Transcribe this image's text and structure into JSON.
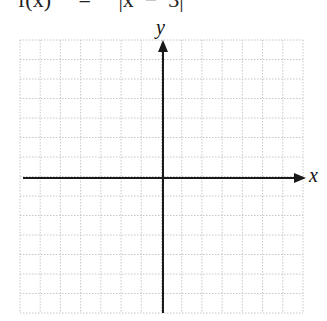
{
  "header": {
    "formula_fragment": "f(x)     =     |x  −  3|"
  },
  "graph": {
    "x_axis_label": "x",
    "y_axis_label": "y",
    "grid": {
      "columns": 14,
      "rows": 14,
      "left": 20,
      "top": 40,
      "right": 303,
      "bottom": 313,
      "line_color": "#c8c8c8",
      "style": "dotted"
    },
    "origin": {
      "x": 163,
      "y": 178
    },
    "axis_color": "#1a1a1a"
  }
}
